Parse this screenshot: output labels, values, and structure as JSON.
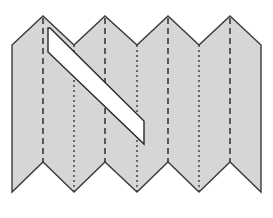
{
  "diagram": {
    "colors": {
      "fill": "#d6d6d6",
      "stroke": "#3a3a3a",
      "cut_fill": "#ffffff",
      "fold_line": "#3a3a3a"
    },
    "outline_points": "12,45 43,16 74,45 105,16 137,45 168,16 199,45 230,16 261,45 261,192 230,162 199,192 168,162 137,192 105,162 74,192 43,162 12,192",
    "cut_points": "48,28 50,28 144,121 144,144 48,52",
    "dashed_folds": [
      {
        "x": 43,
        "y1": 18,
        "y2": 162
      },
      {
        "x": 105,
        "y1": 18,
        "y2": 162
      },
      {
        "x": 168,
        "y1": 18,
        "y2": 162
      },
      {
        "x": 230,
        "y1": 18,
        "y2": 162
      }
    ],
    "dotted_folds": [
      {
        "x": 74,
        "y1": 45,
        "y2": 192
      },
      {
        "x": 137,
        "y1": 45,
        "y2": 192
      },
      {
        "x": 199,
        "y1": 45,
        "y2": 192
      }
    ]
  }
}
